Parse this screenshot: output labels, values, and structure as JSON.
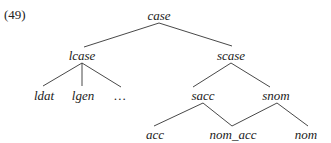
{
  "example_number": "(49)",
  "tree": {
    "root": "case",
    "nodes": [
      {
        "id": "case",
        "label": "case",
        "x": 159,
        "y": 20
      },
      {
        "id": "lcase",
        "label": "lcase",
        "x": 82,
        "y": 60
      },
      {
        "id": "scase",
        "label": "scase",
        "x": 231,
        "y": 60
      },
      {
        "id": "ldat",
        "label": "ldat",
        "x": 44,
        "y": 100
      },
      {
        "id": "lgen",
        "label": "lgen",
        "x": 83,
        "y": 100
      },
      {
        "id": "ellipsis",
        "label": "…",
        "x": 120,
        "y": 100
      },
      {
        "id": "sacc",
        "label": "sacc",
        "x": 203,
        "y": 100
      },
      {
        "id": "snom",
        "label": "snom",
        "x": 276,
        "y": 100
      },
      {
        "id": "acc",
        "label": "acc",
        "x": 155,
        "y": 139
      },
      {
        "id": "nom_acc",
        "label": "nom_acc",
        "x": 233,
        "y": 139
      },
      {
        "id": "nom",
        "label": "nom",
        "x": 306,
        "y": 139
      }
    ],
    "edges": [
      {
        "from": "case",
        "to": "lcase",
        "x1": 159,
        "y1": 23,
        "x2": 84,
        "y2": 47
      },
      {
        "from": "case",
        "to": "scase",
        "x1": 159,
        "y1": 23,
        "x2": 232,
        "y2": 46
      },
      {
        "from": "lcase",
        "to": "ldat",
        "x1": 82,
        "y1": 63,
        "x2": 43,
        "y2": 86
      },
      {
        "from": "lcase",
        "to": "lgen",
        "x1": 82,
        "y1": 63,
        "x2": 82,
        "y2": 86
      },
      {
        "from": "lcase",
        "to": "ellipsis",
        "x1": 82,
        "y1": 63,
        "x2": 121,
        "y2": 87
      },
      {
        "from": "scase",
        "to": "sacc",
        "x1": 231,
        "y1": 63,
        "x2": 193,
        "y2": 87
      },
      {
        "from": "scase",
        "to": "snom",
        "x1": 231,
        "y1": 63,
        "x2": 270,
        "y2": 87
      },
      {
        "from": "sacc",
        "to": "acc",
        "x1": 203,
        "y1": 103,
        "x2": 154,
        "y2": 126
      },
      {
        "from": "sacc",
        "to": "nom_acc",
        "x1": 203,
        "y1": 103,
        "x2": 232,
        "y2": 126
      },
      {
        "from": "snom",
        "to": "nom_acc",
        "x1": 277,
        "y1": 103,
        "x2": 232,
        "y2": 126
      },
      {
        "from": "snom",
        "to": "nom",
        "x1": 277,
        "y1": 103,
        "x2": 308,
        "y2": 126
      }
    ]
  }
}
